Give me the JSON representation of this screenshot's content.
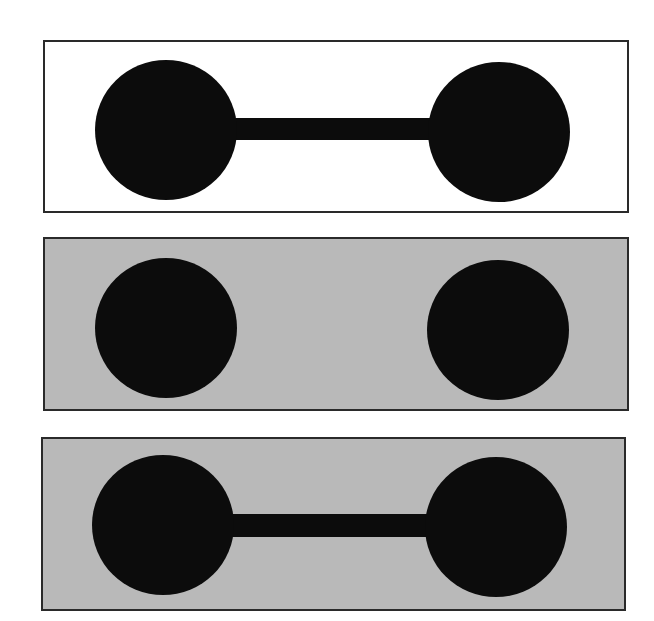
{
  "figure": {
    "width": 654,
    "height": 621,
    "background": "#ffffff",
    "ink_color": "#0c0c0c",
    "border_color": "#2a2a2a",
    "panels": [
      {
        "id": "panel-1",
        "description": "Two black disks joined by a horizontal bar on white background",
        "box": {
          "x": 43,
          "y": 40,
          "w": 586,
          "h": 173
        },
        "fill": "#ffffff",
        "left_disk": {
          "cx": 166,
          "cy": 130,
          "rx": 71,
          "ry": 70
        },
        "right_disk": {
          "cx": 499,
          "cy": 132,
          "rx": 71,
          "ry": 70
        },
        "bar": {
          "x": 234,
          "y": 118,
          "w": 198,
          "h": 22
        },
        "connected": true
      },
      {
        "id": "panel-2",
        "description": "Two separate black disks on gray background (no connecting bar)",
        "box": {
          "x": 43,
          "y": 237,
          "w": 586,
          "h": 174
        },
        "fill": "#b9b9b9",
        "left_disk": {
          "cx": 166,
          "cy": 328,
          "rx": 71,
          "ry": 70
        },
        "right_disk": {
          "cx": 498,
          "cy": 330,
          "rx": 71,
          "ry": 70
        },
        "bar": null,
        "connected": false
      },
      {
        "id": "panel-3",
        "description": "Two black disks joined by a horizontal bar on gray background",
        "box": {
          "x": 41,
          "y": 437,
          "w": 585,
          "h": 174
        },
        "fill": "#b9b9b9",
        "left_disk": {
          "cx": 163,
          "cy": 525,
          "rx": 71,
          "ry": 70
        },
        "right_disk": {
          "cx": 496,
          "cy": 527,
          "rx": 71,
          "ry": 70
        },
        "bar": {
          "x": 231,
          "y": 514,
          "w": 200,
          "h": 23
        },
        "connected": true
      }
    ]
  }
}
